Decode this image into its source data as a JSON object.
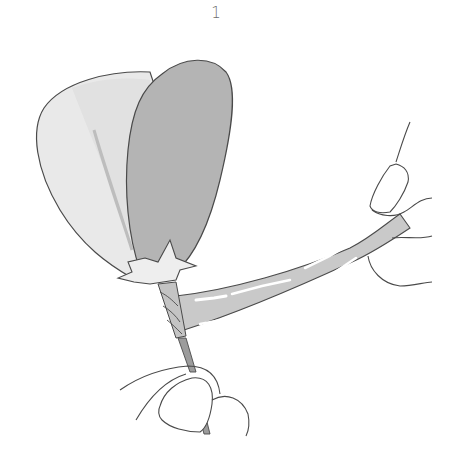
{
  "figure": {
    "step_number": "1",
    "elements": {
      "back_petal": "light-gray-petal",
      "front_petal": "dark-gray-petal",
      "calyx": "star-shaped-calyx",
      "stem": "wire-stem",
      "tape": "floral-tape-strip",
      "left_hand": "hand-holding-stem",
      "right_hand": "hand-holding-tape"
    },
    "colors": {
      "background": "#ffffff",
      "outline": "#4a4a4a",
      "back_petal": "#e9e9e9",
      "back_petal_shade": "#d6d6d6",
      "front_petal": "#b4b4b4",
      "calyx": "#eeeeee",
      "tape": "#c9c9c9",
      "tape_highlight": "#ffffff",
      "stem": "#9c9c9c",
      "wrapped_stem": "#c4c4c4"
    }
  }
}
